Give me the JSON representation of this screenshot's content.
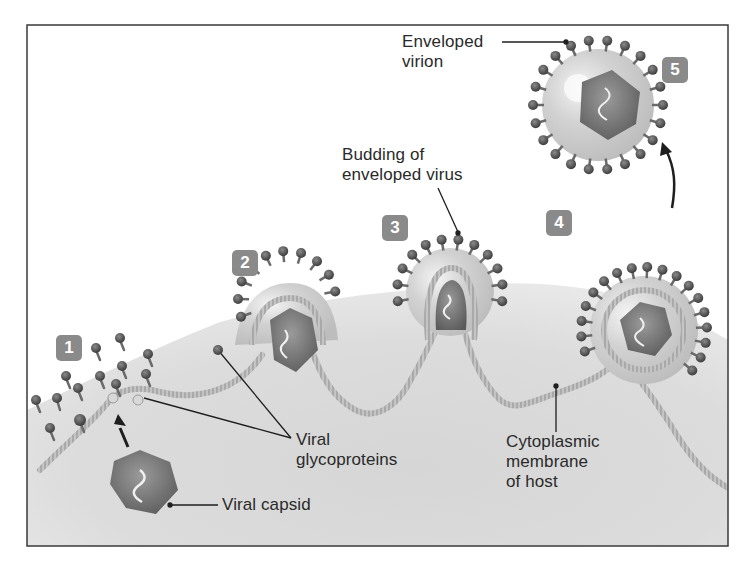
{
  "figure": {
    "colors": {
      "frame": "#3a3a3a",
      "cytoplasm": "#d9d9d9",
      "cytoplasm_light": "#ececec",
      "membrane": "#b9b9b9",
      "envelope": "#cfcfcf",
      "capsid": "#6e6e6e",
      "spike_head": "#4a4a4a",
      "badge": "#8a8a8a",
      "leader": "#1e1e1e",
      "text": "#2a2a2a"
    },
    "steps": [
      {
        "number": "1",
        "x": 56,
        "y": 335
      },
      {
        "number": "2",
        "x": 232,
        "y": 250
      },
      {
        "number": "3",
        "x": 382,
        "y": 215
      },
      {
        "number": "4",
        "x": 546,
        "y": 210
      },
      {
        "number": "5",
        "x": 662,
        "y": 57
      }
    ],
    "labels": {
      "enveloped_virion": [
        "Enveloped",
        "virion"
      ],
      "budding": [
        "Budding of",
        "enveloped virus"
      ],
      "viral_glycoproteins": [
        "Viral",
        "glycoproteins"
      ],
      "viral_capsid": "Viral capsid",
      "cytoplasmic_membrane": [
        "Cytoplasmic",
        "membrane",
        "of host"
      ]
    }
  }
}
